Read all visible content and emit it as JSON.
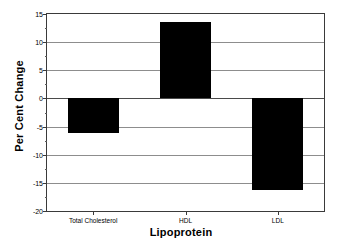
{
  "chart_data": {
    "type": "bar",
    "title": "",
    "xlabel": "Lipoprotein",
    "ylabel": "Per Cent Change",
    "categories": [
      "Total Cholesterol",
      "HDL",
      "LDL"
    ],
    "values": [
      -6.2,
      13.5,
      -16.2
    ],
    "series": [
      {
        "name": "Per Cent Change",
        "values": [
          -6.2,
          13.5,
          -16.2
        ]
      }
    ],
    "ylim": [
      -20,
      15
    ],
    "yticks": [
      15,
      10,
      5,
      0,
      -5,
      -10,
      -15,
      -20
    ],
    "ytick_labels": [
      "15",
      "10",
      "5",
      "0",
      "-5",
      "-10",
      "-15",
      "-20"
    ],
    "yminor_ticks": [
      12.5,
      7.5,
      2.5,
      -2.5,
      -7.5,
      -12.5,
      -17.5
    ],
    "grid": true,
    "grid_axis": "y",
    "legend": false,
    "legend_position": "none",
    "bar_color": "#000000",
    "axis_color": "#3a3a3a",
    "grid_color": "#8d8d8d",
    "background": "#ffffff",
    "bar_width_fraction": 0.55
  }
}
